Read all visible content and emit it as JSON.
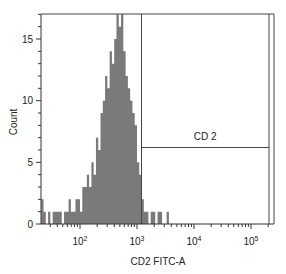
{
  "chart_data": {
    "type": "bar",
    "title": "",
    "xlabel": "CD2 FITC-A",
    "ylabel": "Count",
    "x_scale": "log",
    "xlim": [
      20,
      300000
    ],
    "ylim": [
      0,
      17
    ],
    "x_ticks": [
      {
        "value": 100,
        "base": "10",
        "exp": "2"
      },
      {
        "value": 1000,
        "base": "10",
        "exp": "3"
      },
      {
        "value": 10000,
        "base": "10",
        "exp": "4"
      },
      {
        "value": 100000,
        "base": "10",
        "exp": "5"
      }
    ],
    "y_ticks": [
      0,
      5,
      10,
      15
    ],
    "grid": false,
    "legend": null,
    "fill_color": "#7a7a7a",
    "gate": {
      "label": "CD 2",
      "x_start": 1200,
      "x_end": 200000,
      "y_level": 6.2
    },
    "histogram": {
      "x_log10": [
        1.32,
        1.36,
        1.4,
        1.44,
        1.48,
        1.52,
        1.56,
        1.6,
        1.64,
        1.68,
        1.72,
        1.76,
        1.8,
        1.84,
        1.88,
        1.92,
        1.96,
        2.0,
        2.04,
        2.08,
        2.12,
        2.16,
        2.2,
        2.24,
        2.28,
        2.32,
        2.36,
        2.4,
        2.44,
        2.48,
        2.52,
        2.56,
        2.6,
        2.64,
        2.68,
        2.72,
        2.76,
        2.8,
        2.84,
        2.88,
        2.92,
        2.96,
        3.0,
        3.04,
        3.08,
        3.12,
        3.16,
        3.2,
        3.24,
        3.28,
        3.32,
        3.36,
        3.4,
        3.44,
        3.48,
        3.52,
        3.56
      ],
      "counts": [
        2,
        1,
        0,
        1,
        0,
        1,
        1,
        1,
        1,
        0,
        1,
        1,
        2,
        1,
        1,
        2,
        2,
        1,
        3,
        3,
        4,
        3,
        5,
        4,
        7,
        6,
        9,
        10,
        12,
        11,
        14,
        13,
        15,
        17,
        16,
        17,
        14,
        12,
        11,
        10,
        9,
        8,
        5,
        4,
        2,
        1,
        1,
        0,
        1,
        1,
        0,
        1,
        1,
        0,
        0,
        1,
        0
      ]
    }
  }
}
